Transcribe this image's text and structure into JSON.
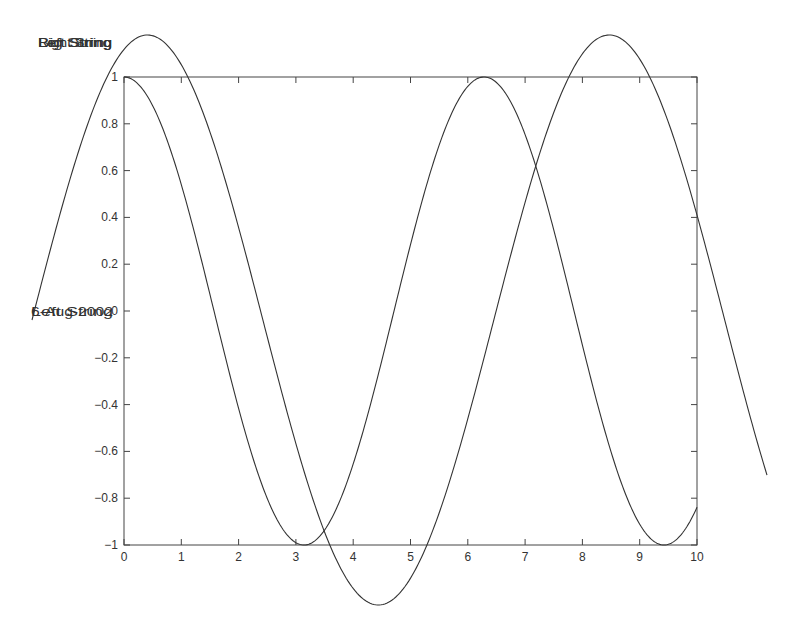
{
  "chart_data": {
    "type": "line",
    "title": "",
    "xlabel": "",
    "ylabel": "",
    "xlim": [
      0,
      10
    ],
    "ylim": [
      -1,
      1
    ],
    "grid": false,
    "x_ticks": [
      0,
      1,
      2,
      3,
      4,
      5,
      6,
      7,
      8,
      9,
      10
    ],
    "x_tick_labels": [
      "0",
      "1",
      "2",
      "3",
      "4",
      "5",
      "6",
      "7",
      "8",
      "9",
      "10"
    ],
    "y_ticks": [
      1,
      0.8,
      0.6,
      0.4,
      0.2,
      0,
      -0.2,
      -0.4,
      -0.6,
      -0.8,
      -1
    ],
    "y_tick_labels": [
      "1",
      "0.8",
      "0.6",
      "0.4",
      "0.2",
      "0",
      "−0.2",
      "−0.4",
      "−0.6",
      "−0.8",
      "−1"
    ],
    "series": [
      {
        "name": "cos(x)",
        "function": "cos",
        "x_range": [
          0,
          10
        ],
        "axes": "main",
        "color": "#333333",
        "sample_points": {
          "x": [
            0,
            1,
            2,
            3,
            3.14,
            4,
            5,
            6,
            6.28,
            7,
            8,
            9,
            9.42,
            10
          ],
          "y": [
            1,
            0.54,
            -0.42,
            -0.99,
            -1,
            -0.65,
            0.28,
            0.96,
            1,
            0.75,
            -0.15,
            -0.91,
            -1,
            -0.84
          ]
        }
      },
      {
        "name": "sin(x)",
        "function": "sin",
        "x_range": [
          0,
          10
        ],
        "axes": "overlay",
        "color": "#333333",
        "sample_points": {
          "x": [
            0,
            1.57,
            3.14,
            4.71,
            6.28,
            7.85,
            10
          ],
          "y": [
            0,
            1,
            0,
            -1,
            0,
            1,
            -0.54
          ]
        }
      }
    ],
    "annotations": {
      "top_left_overlapped": [
        "Right String",
        "Left String",
        "Big String"
      ],
      "mid_left_overlapped": [
        "6-Aug-2002",
        "Left String"
      ]
    },
    "legend": null
  },
  "layout": {
    "main_axes": {
      "left": 124,
      "right": 697,
      "top": 77,
      "bottom": 545
    },
    "overlay_axes": {
      "left": 32,
      "right": 767,
      "top": 35,
      "bottom": 605
    },
    "line_color": "#333333",
    "axis_color": "#444444"
  }
}
